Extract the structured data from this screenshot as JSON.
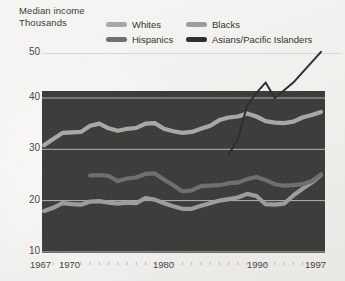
{
  "header": {
    "title_line1": "Median income",
    "title_line2": "Thousands"
  },
  "legend": {
    "position": "top",
    "items": [
      {
        "label": "Whites",
        "color": "#a8a8a4",
        "swatch_name": "legend-swatch-whites"
      },
      {
        "label": "Blacks",
        "color": "#9d9d99",
        "swatch_name": "legend-swatch-blacks"
      },
      {
        "label": "Hispanics",
        "color": "#6f6f6c",
        "swatch_name": "legend-swatch-hispanics"
      },
      {
        "label": "Asians/Pacific Islanders",
        "color": "#2f2f2d",
        "swatch_name": "legend-swatch-asians"
      }
    ]
  },
  "axes": {
    "y_ticks": [
      "50",
      "40",
      "30",
      "20",
      "10"
    ],
    "x_ticks": [
      "1967",
      "1970",
      "1980",
      "1990",
      "1997"
    ],
    "ylim": [
      10,
      50
    ],
    "xlim": [
      1967,
      1997
    ],
    "grid": "horizontal"
  },
  "colors": {
    "plot_background": "#3b3b39",
    "page_background": "#f2f1ef",
    "gridline": "#d9d8d4",
    "gridline_inner": "#c9c8c4",
    "text": "#3c3c3a"
  },
  "chart_data": {
    "type": "line",
    "title": "Median income",
    "subtitle": "Thousands",
    "xlabel": "",
    "ylabel": "Thousands",
    "ylim": [
      10,
      50
    ],
    "xlim": [
      1967,
      1997
    ],
    "grid": true,
    "grid_values": [
      50,
      40,
      30,
      20,
      10
    ],
    "legend_position": "top",
    "x": [
      1967,
      1968,
      1969,
      1970,
      1971,
      1972,
      1973,
      1974,
      1975,
      1976,
      1977,
      1978,
      1979,
      1980,
      1981,
      1982,
      1983,
      1984,
      1985,
      1986,
      1987,
      1988,
      1989,
      1990,
      1991,
      1992,
      1993,
      1994,
      1995,
      1996,
      1997
    ],
    "series": [
      {
        "name": "Whites",
        "color": "#a8a8a4",
        "values": [
          30.8,
          32.0,
          33.2,
          33.3,
          33.4,
          34.6,
          35.0,
          34.1,
          33.6,
          34.0,
          34.2,
          35.0,
          35.1,
          34.0,
          33.5,
          33.2,
          33.4,
          34.0,
          34.6,
          35.7,
          36.2,
          36.4,
          37.0,
          36.4,
          35.5,
          35.2,
          35.1,
          35.4,
          36.2,
          36.7,
          37.3
        ]
      },
      {
        "name": "Blacks",
        "color": "#9d9d99",
        "values": [
          18.0,
          18.6,
          19.5,
          19.3,
          19.2,
          19.8,
          19.9,
          19.6,
          19.4,
          19.6,
          19.5,
          20.5,
          20.2,
          19.5,
          18.9,
          18.4,
          18.4,
          19.0,
          19.5,
          20.0,
          20.3,
          20.6,
          21.3,
          20.9,
          19.3,
          19.2,
          19.4,
          21.0,
          22.3,
          23.5,
          25.0
        ]
      },
      {
        "name": "Hispanics",
        "color": "#6f6f6c",
        "values": [
          null,
          null,
          null,
          null,
          null,
          24.9,
          25.0,
          24.8,
          23.8,
          24.3,
          24.5,
          25.2,
          25.3,
          24.1,
          23.0,
          21.8,
          22.0,
          22.8,
          22.9,
          23.0,
          23.4,
          23.5,
          24.2,
          24.6,
          24.0,
          23.2,
          22.9,
          23.0,
          23.2,
          23.8,
          25.1
        ]
      },
      {
        "name": "Asians/Pacific Islanders",
        "color": "#2f2f2d",
        "values": [
          null,
          null,
          null,
          null,
          null,
          null,
          null,
          null,
          null,
          null,
          null,
          null,
          null,
          null,
          null,
          null,
          null,
          null,
          null,
          null,
          29.0,
          32.0,
          38.5,
          41.0,
          43.0,
          40.0,
          41.5,
          43.0,
          45.0,
          47.0,
          49.0
        ]
      }
    ]
  }
}
